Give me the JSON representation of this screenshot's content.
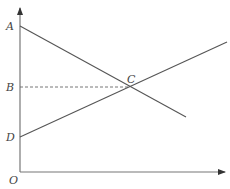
{
  "diagram": {
    "type": "coordinate-geometry",
    "colors": {
      "line": "#555555",
      "axis": "#777777",
      "dashed": "#666666",
      "label": "#444444",
      "background": "#ffffff"
    },
    "points": {
      "A": {
        "label": "A",
        "x": 20,
        "y": 26
      },
      "B": {
        "label": "B",
        "x": 20,
        "y": 87
      },
      "C": {
        "label": "C",
        "x": 130,
        "y": 87
      },
      "D": {
        "label": "D",
        "x": 20,
        "y": 137
      },
      "O": {
        "label": "O",
        "x": 20,
        "y": 172
      }
    },
    "lines": [
      {
        "name": "line-through-A-and-C",
        "from": "A",
        "through": "C",
        "to": [
          186,
          117
        ]
      },
      {
        "name": "line-through-D-and-C",
        "from": "D",
        "through": "C",
        "to": [
          227,
          42
        ]
      },
      {
        "name": "dashed-B-to-C",
        "from": "B",
        "to": "C",
        "style": "dashed"
      }
    ],
    "axes": {
      "x": {
        "from": [
          20,
          172
        ],
        "to": [
          225,
          172
        ],
        "arrow": true
      },
      "y": {
        "from": [
          20,
          172
        ],
        "to": [
          20,
          7
        ],
        "arrow": true
      }
    }
  }
}
